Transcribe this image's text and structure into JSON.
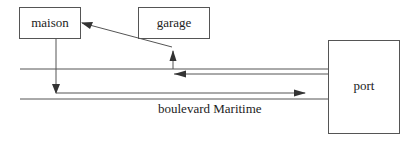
{
  "diagram": {
    "nodes": [
      {
        "id": "maison",
        "label": "maison"
      },
      {
        "id": "garage",
        "label": "garage"
      },
      {
        "id": "port",
        "label": "port"
      }
    ],
    "road_label": "boulevard Maritime",
    "edges": [
      {
        "from": "maison",
        "to": "boulevard",
        "direction": "down then right to port"
      },
      {
        "from": "port",
        "to": "boulevard",
        "direction": "left then up and to maison"
      }
    ],
    "colors": {
      "stroke": "#555555",
      "text": "#222222",
      "background": "#ffffff"
    }
  }
}
